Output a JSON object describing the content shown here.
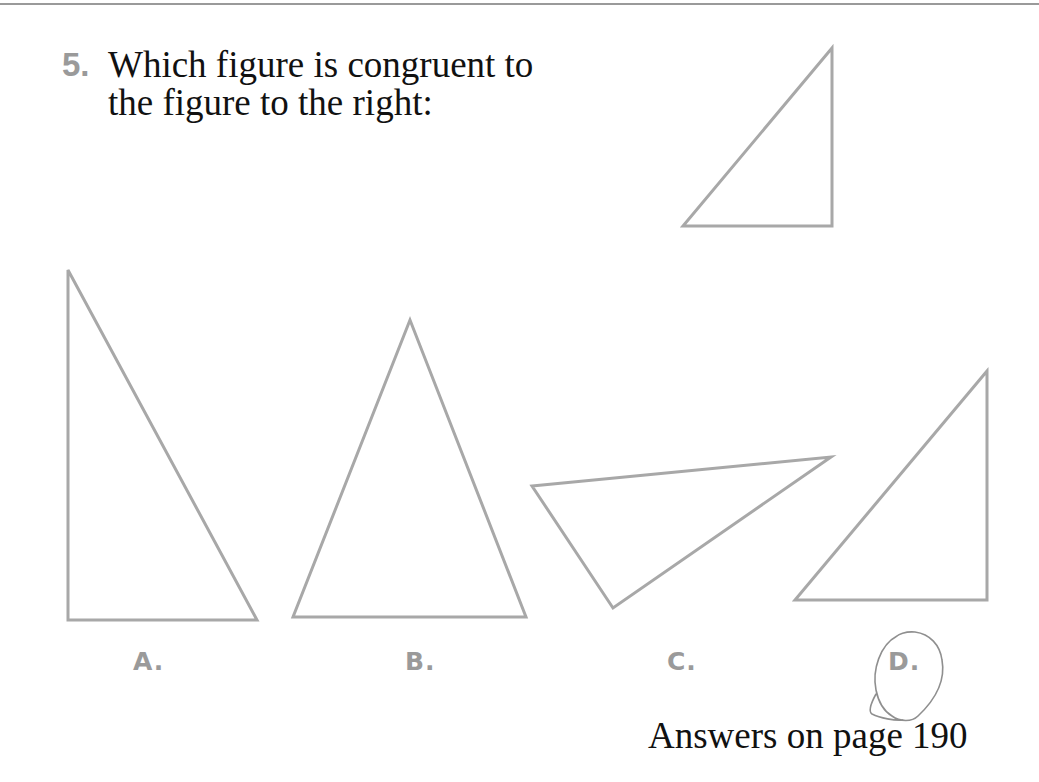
{
  "question": {
    "number": "5.",
    "line1": "Which figure is congruent to",
    "line2": "the figure to the right:"
  },
  "reference_figure": {
    "points": "832,48 683,226 832,226",
    "type": "right triangle"
  },
  "options": [
    {
      "label": "A.",
      "points": "68,270 68,620 257,620"
    },
    {
      "label": "B.",
      "points": "410,320 293,617 526,617"
    },
    {
      "label": "C.",
      "points": "532,486 831,457 613,608"
    },
    {
      "label": "D.",
      "points": "987,371 795,600 987,600",
      "circled": true
    }
  ],
  "footer": {
    "answers_text": "Answers on page 190"
  },
  "colors": {
    "figure_stroke": "#a8a8a8",
    "label": "#9a9a9a",
    "text": "#111111",
    "pencil_mark": "#8f8f8f"
  }
}
